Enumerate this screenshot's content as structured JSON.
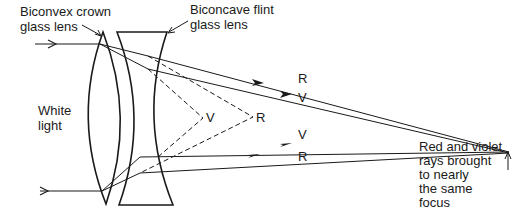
{
  "labels": {
    "crown_lens": "Biconvex crown\nglass lens",
    "flint_lens": "Biconcave flint\nglass lens",
    "white_light": "White\nlight",
    "focus_note": "Red and violet\nrays brought\nto nearly\nthe same\nfocus"
  },
  "ray_labels": {
    "upper_R": "R",
    "upper_V": "V",
    "virtual_V": "V",
    "virtual_R": "R",
    "lower_V": "V",
    "lower_R": "R"
  },
  "colors": {
    "line": "#1a1a1a",
    "background": "#ffffff"
  }
}
